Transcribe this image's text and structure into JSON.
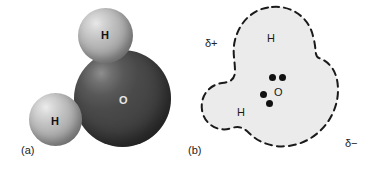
{
  "figure": {
    "background_color": "#ffffff"
  },
  "panel_a": {
    "caption": "(a)",
    "description": "space-filling model of water",
    "atoms": [
      {
        "symbol": "H",
        "name": "hydrogen-top",
        "color": "#b9b9b9",
        "cx": 105,
        "cy": 35,
        "r": 27
      },
      {
        "symbol": "H",
        "name": "hydrogen-left",
        "color": "#bdbdbd",
        "cx": 55,
        "cy": 120,
        "r": 26
      },
      {
        "symbol": "O",
        "name": "oxygen",
        "color": "#434343",
        "cx": 122,
        "cy": 98,
        "r": 48
      }
    ],
    "labels": {
      "h_top": "H",
      "h_left": "H",
      "oxygen": "O"
    }
  },
  "panel_b": {
    "caption": "(b)",
    "description": "electron cloud outline showing partial charges",
    "cloud_fill": "#ebebeb",
    "outline_color": "#1a1a1a",
    "outline_style": "dashed",
    "labels": {
      "h_top": "H",
      "h_left": "H",
      "oxygen": "O",
      "delta_plus": "δ+",
      "delta_minus": "δ−"
    },
    "electron_pairs": [
      {
        "name": "lone-pair-upper-left",
        "x": 272,
        "y": 78
      },
      {
        "name": "lone-pair-upper-right",
        "x": 282,
        "y": 78
      },
      {
        "name": "bond-pair-left",
        "x": 263,
        "y": 95
      },
      {
        "name": "bond-pair-lower",
        "x": 269,
        "y": 104
      }
    ]
  }
}
